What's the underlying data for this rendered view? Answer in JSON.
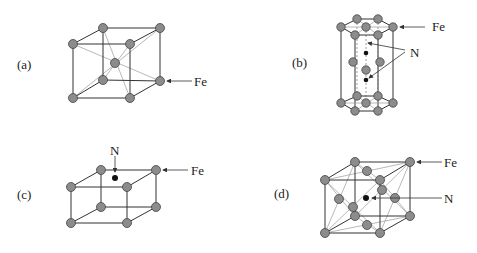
{
  "figure": {
    "panels": [
      {
        "id": "a",
        "label": "(a)",
        "structure": "body-centered cubic Fe",
        "annotations": [
          "Fe"
        ]
      },
      {
        "id": "b",
        "label": "(b)",
        "structure": "hexagonal Fe with N interstitials",
        "annotations": [
          "Fe",
          "N"
        ]
      },
      {
        "id": "c",
        "label": "(c)",
        "structure": "tetragonal Fe with N",
        "annotations": [
          "N",
          "Fe"
        ]
      },
      {
        "id": "d",
        "label": "(d)",
        "structure": "face-centered cubic Fe with central N",
        "annotations": [
          "Fe",
          "N"
        ]
      }
    ]
  },
  "labels": {
    "a": "(a)",
    "b": "(b)",
    "c": "(c)",
    "d": "(d)",
    "fe": "Fe",
    "n": "N"
  },
  "colors": {
    "fe_atom": "#8c8c8c",
    "n_atom": "#111111",
    "lines": "#333333"
  }
}
